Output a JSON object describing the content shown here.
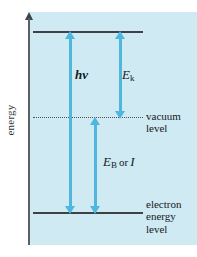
{
  "figure": {
    "type": "energy-level-diagram",
    "axis": {
      "label": "energy",
      "direction": "up"
    },
    "levels": [
      {
        "id": "upper",
        "style": "solid",
        "label": ""
      },
      {
        "id": "vacuum",
        "style": "dotted",
        "label_line1": "vacuum",
        "label_line2": "level"
      },
      {
        "id": "electron",
        "style": "solid",
        "label_line1": "electron",
        "label_line2": "energy",
        "label_line3": "level"
      }
    ],
    "arrows": [
      {
        "id": "hv",
        "label_plain": "hv",
        "label_symbol": "hν",
        "from": "electron",
        "to": "upper"
      },
      {
        "id": "ek",
        "label_plain": "Ek",
        "label_base": "E",
        "label_sub": "k",
        "from": "vacuum",
        "to": "upper"
      },
      {
        "id": "eb",
        "label_plain": "EB or I",
        "label_base": "E",
        "label_sub": "B",
        "conjunction": "or",
        "label_alt": "I",
        "from": "electron",
        "to": "vacuum"
      }
    ],
    "colors": {
      "panel_background": "#cfeaf3",
      "arrow": "#4fb6dd",
      "line": "#3c4245",
      "text": "#16191b",
      "page_background": "#ffffff"
    }
  },
  "chart_data": {
    "type": "diagram",
    "ylabel": "energy",
    "levels": [
      {
        "name": "upper level",
        "relative_energy": 1.0,
        "line_style": "solid",
        "label": ""
      },
      {
        "name": "vacuum level",
        "relative_energy": 0.525,
        "line_style": "dotted",
        "label": "vacuum level"
      },
      {
        "name": "electron energy level",
        "relative_energy": 0.0,
        "line_style": "solid",
        "label": "electron energy level"
      }
    ],
    "transitions": [
      {
        "name": "hν",
        "from_level": "electron energy level",
        "to_level": "upper level",
        "span": 1.0
      },
      {
        "name": "E_k",
        "from_level": "vacuum level",
        "to_level": "upper level",
        "span": 0.475
      },
      {
        "name": "E_B or I",
        "from_level": "electron energy level",
        "to_level": "vacuum level",
        "span": 0.525
      }
    ],
    "grid": false,
    "legend": "none"
  }
}
